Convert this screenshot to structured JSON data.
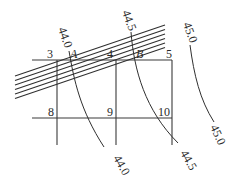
{
  "diagram": {
    "type": "contour-grid-with-hatched-band",
    "colors": {
      "line": "#333333",
      "background": "#ffffff"
    },
    "grid": {
      "corner_labels": [
        {
          "id": "3",
          "label": "3"
        },
        {
          "id": "4",
          "label": "4"
        },
        {
          "id": "5",
          "label": "5"
        },
        {
          "id": "8",
          "label": "8"
        },
        {
          "id": "9",
          "label": "9"
        },
        {
          "id": "10",
          "label": "10"
        }
      ]
    },
    "points": [
      {
        "id": "A",
        "label": "A"
      },
      {
        "id": "B",
        "label": "B"
      }
    ],
    "contours": [
      {
        "value": "44.0",
        "label_top": "44.0",
        "label_bottom": "44.0"
      },
      {
        "value": "44.5",
        "label_top": "44.5",
        "label_bottom": "44.5"
      },
      {
        "value": "45.0",
        "label_top": "45.0",
        "label_bottom": "45.0"
      }
    ],
    "hatched_band": {
      "line_count": 6
    }
  }
}
